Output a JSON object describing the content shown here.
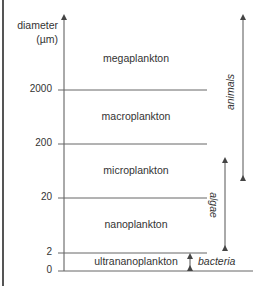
{
  "axis": {
    "title_line1": "diameter",
    "title_line2": "(µm)"
  },
  "ticks": [
    {
      "label": "2000",
      "value": 2000
    },
    {
      "label": "200",
      "value": 200
    },
    {
      "label": "20",
      "value": 20
    },
    {
      "label": "2",
      "value": 2
    },
    {
      "label": "0",
      "value": 0
    }
  ],
  "bands": [
    {
      "label": "megaplankton",
      "range": "> 2000 µm"
    },
    {
      "label": "macroplankton",
      "range": "200–2000 µm"
    },
    {
      "label": "microplankton",
      "range": "20–200 µm"
    },
    {
      "label": "nanoplankton",
      "range": "2–20 µm"
    },
    {
      "label": "ultrananoplankton",
      "range": "0–2 µm"
    }
  ],
  "groups": {
    "animals": {
      "label": "animals",
      "span": "microplankton to megaplankton"
    },
    "algae": {
      "label": "algae",
      "span": "nanoplankton to microplankton"
    },
    "bacteria": {
      "label": "bacteria",
      "span": "ultrananoplankton"
    }
  },
  "colors": {
    "line": "#555555",
    "text": "#333333",
    "background": "#ffffff"
  }
}
